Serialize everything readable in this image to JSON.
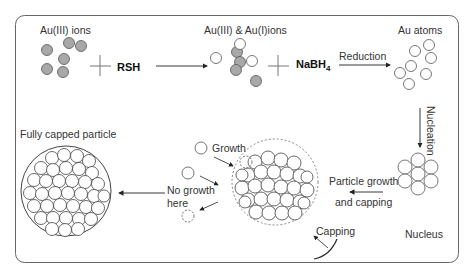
{
  "diagram": {
    "type": "process-flow",
    "title": "",
    "colors": {
      "frame": "#555555",
      "ion_fill": "#a8a8a8",
      "atom_fill": "#ffffff",
      "stroke": "#444444",
      "text": "#333333"
    },
    "nodes": {
      "au3_ions": {
        "label": "Au(III) ions"
      },
      "rsh": {
        "label": "RSH"
      },
      "mixed_ions": {
        "label": "Au(III) & Au(I)ions"
      },
      "nabh4": {
        "label": "NaBH",
        "subscript": "4"
      },
      "au_atoms": {
        "label": "Au atoms"
      },
      "nucleus": {
        "label": "Nucleus"
      },
      "growing_particle": {
        "label": ""
      },
      "fully_capped": {
        "label": "Fully capped particle"
      }
    },
    "edges": {
      "rsh_to_mixed": {
        "label": ""
      },
      "reduction": {
        "label": "Reduction"
      },
      "nucleation": {
        "label": "Nucleation"
      },
      "particle_growth": {
        "label_line1": "Particle growth",
        "label_line2": "and capping"
      },
      "to_fully_capped": {
        "label": ""
      }
    },
    "annotations": {
      "growth": "Growth",
      "no_growth_line1": "No growth",
      "no_growth_line2": "here",
      "capping": "Capping"
    },
    "operators": {
      "plus": "+"
    }
  }
}
